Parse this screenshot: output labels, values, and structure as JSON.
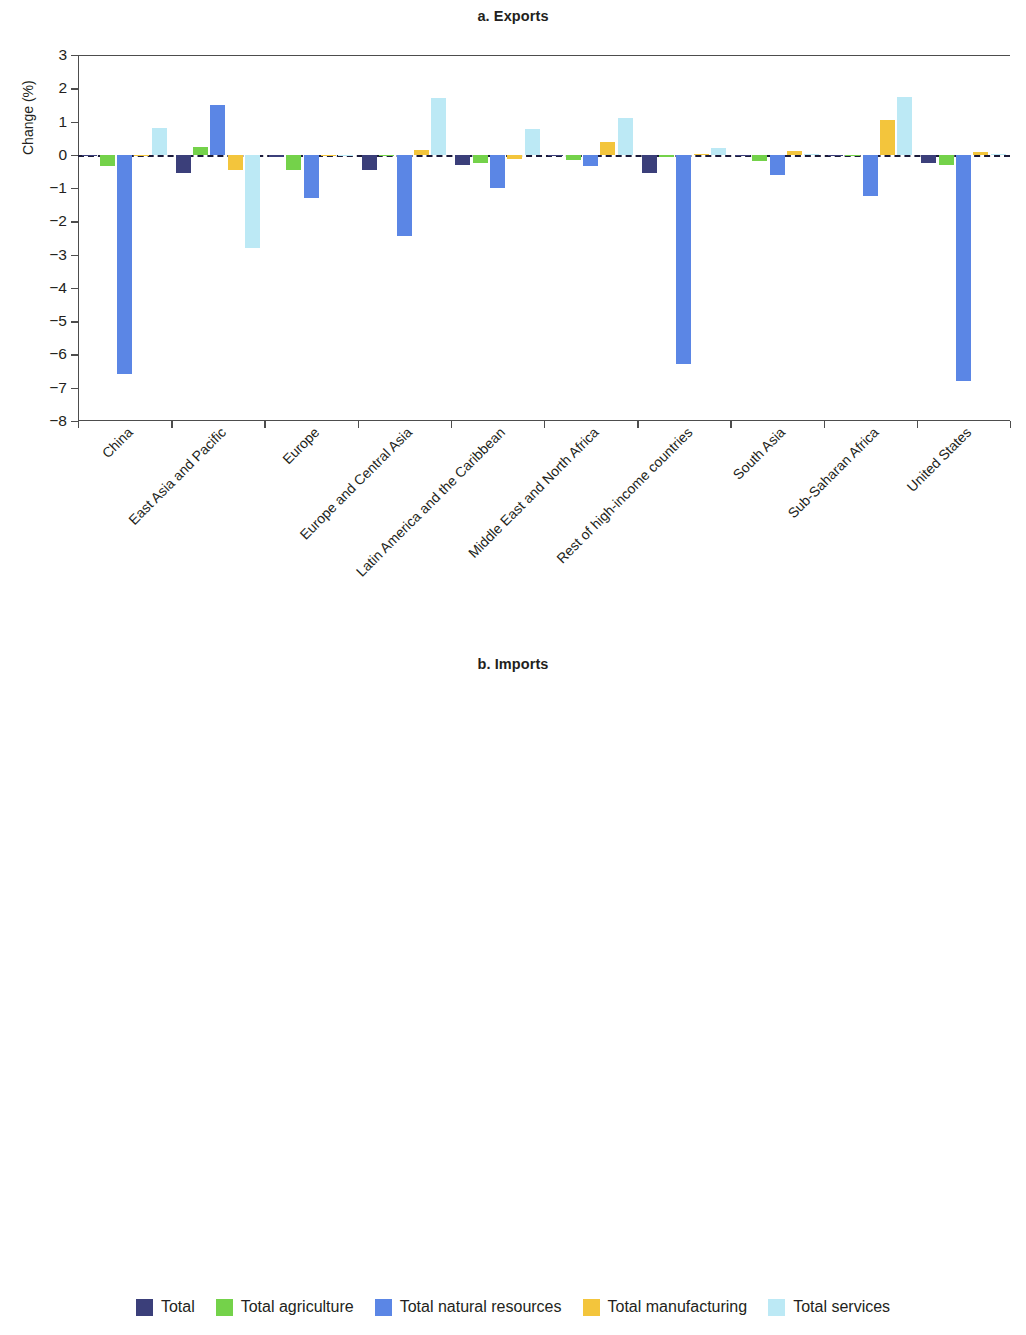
{
  "figure": {
    "ylabel": "Change (%)"
  },
  "legend": {
    "items": [
      {
        "label": "Total",
        "color": "#3b3f7a"
      },
      {
        "label": "Total agriculture",
        "color": "#74d24a"
      },
      {
        "label": "Total natural resources",
        "color": "#5b86e5"
      },
      {
        "label": "Total manufacturing",
        "color": "#f3c53c"
      },
      {
        "label": "Total services",
        "color": "#bce9f5"
      }
    ]
  },
  "chart_data": [
    {
      "type": "bar",
      "title": "a. Exports",
      "xlabel": "",
      "ylabel": "Change (%)",
      "ylim": [
        -8,
        3
      ],
      "yticks": [
        3,
        2,
        1,
        0,
        -1,
        -2,
        -3,
        -4,
        -5,
        -6,
        -7,
        -8
      ],
      "ytick_labels": [
        "3",
        "2",
        "1",
        "0",
        "−1",
        "−2",
        "−3",
        "−4",
        "−5",
        "−6",
        "−7",
        "−8"
      ],
      "grid": false,
      "legend_position": "bottom",
      "categories": [
        "China",
        "East Asia and Pacific",
        "Europe",
        "Europe and Central Asia",
        "Latin America and the Caribbean",
        "Middle East and North Africa",
        "Rest of high-income countries",
        "South Asia",
        "Sub-Saharan Africa",
        "United States"
      ],
      "series": [
        {
          "name": "Total",
          "color": "#3b3f7a",
          "values": [
            -0.04,
            -0.55,
            -0.08,
            -0.45,
            -0.3,
            -0.04,
            -0.55,
            -0.03,
            -0.05,
            -0.25
          ]
        },
        {
          "name": "Total agriculture",
          "color": "#74d24a",
          "values": [
            -0.35,
            0.22,
            -0.45,
            -0.04,
            -0.25,
            -0.15,
            -0.06,
            -0.2,
            -0.02,
            -0.3
          ]
        },
        {
          "name": "Total natural resources",
          "color": "#5b86e5",
          "values": [
            -6.6,
            1.5,
            -1.3,
            -2.45,
            -1.0,
            -0.35,
            -6.3,
            -0.6,
            -1.25,
            -6.8
          ]
        },
        {
          "name": "Total manufacturing",
          "color": "#f3c53c",
          "values": [
            -0.03,
            -0.45,
            -0.03,
            0.15,
            -0.12,
            0.4,
            0.03,
            0.12,
            1.05,
            0.08
          ]
        },
        {
          "name": "Total services",
          "color": "#bce9f5",
          "values": [
            0.8,
            -2.8,
            -0.02,
            1.7,
            0.78,
            1.1,
            0.2,
            0.02,
            1.75,
            0.02
          ]
        }
      ]
    },
    {
      "type": "bar",
      "title": "b. Imports",
      "xlabel": "",
      "ylabel": "Change (%)",
      "ylim": [
        -6,
        2
      ],
      "yticks": [
        2,
        1,
        0,
        -1,
        -2,
        -3,
        -4,
        -5,
        -6
      ],
      "ytick_labels": [
        "2",
        "1",
        "0",
        "−1",
        "−2",
        "−3",
        "−4",
        "−5",
        "−6"
      ],
      "grid": false,
      "legend_position": "bottom",
      "categories": [
        "China",
        "East Asia and Pacific",
        "Europe",
        "Europe and Central Asia",
        "Latin America and the Caribbean",
        "Middle East and North Africa",
        "Rest of high-income countries",
        "South Asia",
        "Sub-Saharan Africa",
        "United States"
      ],
      "series": [
        {
          "name": "Total",
          "color": "#3b3f7a",
          "values": [
            -0.02,
            -0.25,
            -0.2,
            -0.42,
            -0.2,
            -0.03,
            -0.55,
            -0.02,
            -0.06,
            -0.18
          ]
        },
        {
          "name": "Total agriculture",
          "color": "#74d24a",
          "values": [
            -0.18,
            -1.0,
            -0.12,
            -0.28,
            -0.18,
            -0.28,
            -0.4,
            0.15,
            -0.32,
            -0.12
          ]
        },
        {
          "name": "Total natural resources",
          "color": "#5b86e5",
          "values": [
            0.85,
            -3.55,
            -3.42,
            -2.92,
            -4.8,
            0.9,
            -3.42,
            0.06,
            0.4,
            -1.38
          ]
        },
        {
          "name": "Total manufacturing",
          "color": "#f3c53c",
          "values": [
            -0.08,
            0.12,
            -0.03,
            -0.1,
            0.03,
            0.03,
            0.08,
            -0.03,
            0.03,
            -0.04
          ]
        },
        {
          "name": "Total services",
          "color": "#bce9f5",
          "values": [
            -0.05,
            0.02,
            0.12,
            -0.45,
            0.2,
            0.02,
            -0.1,
            0.03,
            0.02,
            0.18
          ]
        }
      ]
    }
  ]
}
